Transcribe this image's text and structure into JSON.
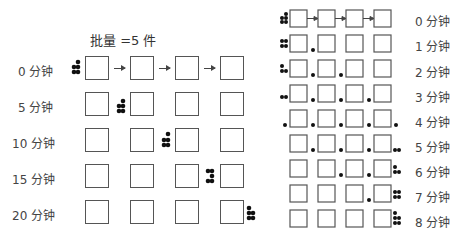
{
  "left_panel": {
    "title": "批量 =5 件",
    "rows": [
      {
        "label": "0 分钟",
        "batch_position": "before-station-1"
      },
      {
        "label": "5 分钟",
        "batch_position": "between-station-1-2"
      },
      {
        "label": "10 分钟",
        "batch_position": "between-station-2-3"
      },
      {
        "label": "15 分钟",
        "batch_position": "between-station-3-4"
      },
      {
        "label": "20 分钟",
        "batch_position": "after-station-4"
      }
    ],
    "stations": 4,
    "batch_size": 5
  },
  "right_panel": {
    "rows": [
      {
        "label": "0 分钟"
      },
      {
        "label": "1 分钟"
      },
      {
        "label": "2 分钟"
      },
      {
        "label": "3 分钟"
      },
      {
        "label": "4 分钟"
      },
      {
        "label": "5 分钟"
      },
      {
        "label": "6 分钟"
      },
      {
        "label": "7 分钟"
      },
      {
        "label": "8 分钟"
      }
    ],
    "stations": 4,
    "queue_counts": [
      5,
      4,
      3,
      2,
      1,
      0,
      0,
      0,
      0
    ],
    "finished_counts": [
      0,
      0,
      0,
      0,
      1,
      2,
      3,
      4,
      5
    ]
  }
}
